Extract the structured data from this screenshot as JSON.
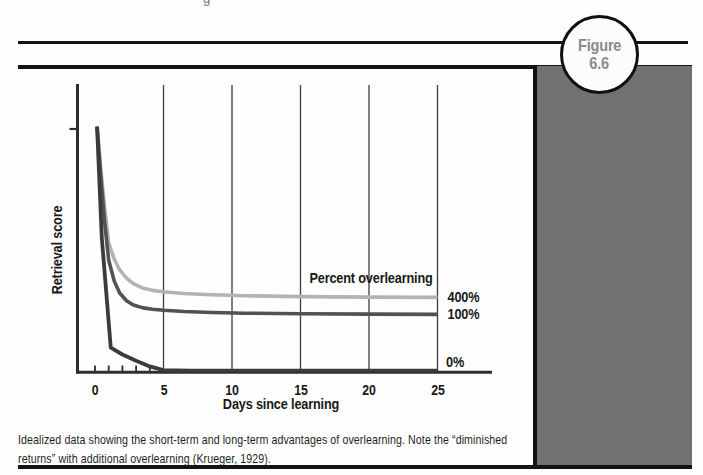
{
  "page": {
    "partial_glyph": "g"
  },
  "figure_badge": {
    "line1": "Figure",
    "line2": "6.6"
  },
  "caption": "Idealized data showing the short-term and long-term advantages of overlearning. Note the “diminished returns” with additional overlearning (Krueger, 1929).",
  "chart_data": {
    "type": "line",
    "title": "",
    "xlabel": "Days since learning",
    "ylabel": "Retrieval score",
    "series_group_label": "Percent overlearning",
    "xlim": [
      0,
      30
    ],
    "ylim": [
      0,
      105
    ],
    "x_ticks": [
      0,
      5,
      10,
      15,
      20,
      25
    ],
    "minor_x_ticks": [
      0,
      1,
      2,
      3,
      4
    ],
    "gridlines_at_x": [
      5,
      10,
      15,
      20,
      25
    ],
    "y_axis_marker_at": 100,
    "grid": "vertical-only",
    "legend_position": "right-of-lines",
    "colors": {
      "axis": "#2e2e2e",
      "gridline": "#3c3c3c",
      "label_text": "#181818",
      "panel_gray": "#717171",
      "badge_text": "#8a8a8a"
    },
    "series": [
      {
        "name": "400%",
        "color": "#b3b3b3",
        "width": 3.6,
        "label_dy": 0,
        "x": [
          0.15,
          0.4,
          0.7,
          1,
          1.4,
          1.8,
          2.3,
          2.8,
          3.5,
          4.2,
          5,
          6.5,
          8.5,
          11,
          15,
          20,
          25
        ],
        "y": [
          101,
          85,
          68,
          53,
          46.5,
          42,
          38.6,
          36.4,
          34.5,
          33.6,
          33,
          32.3,
          31.8,
          31.4,
          31,
          30.8,
          30.7
        ]
      },
      {
        "name": "100%",
        "color": "#525252",
        "width": 3.6,
        "label_dy": 0,
        "x": [
          0.15,
          0.4,
          0.7,
          1,
          1.4,
          1.8,
          2.3,
          2.8,
          3.5,
          4.2,
          5,
          6.5,
          8.5,
          11,
          15,
          20,
          25
        ],
        "y": [
          101,
          82,
          62,
          46,
          37.5,
          32.5,
          29.3,
          27.6,
          26.4,
          25.8,
          25.4,
          24.9,
          24.5,
          24.2,
          24,
          23.8,
          23.7
        ]
      },
      {
        "name": "0%",
        "color": "#3b3b3b",
        "width": 3.8,
        "label_dy": -9,
        "x": [
          0.15,
          0.5,
          1.15,
          2,
          3,
          4,
          5,
          7,
          10,
          15,
          20,
          25
        ],
        "y": [
          101,
          55,
          10,
          7.2,
          4.6,
          2.3,
          0.8,
          0.6,
          0.6,
          0.6,
          0.6,
          0.6
        ]
      }
    ]
  }
}
